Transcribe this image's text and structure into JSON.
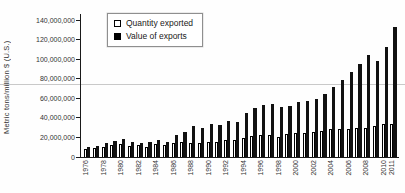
{
  "chart_data": {
    "type": "bar",
    "title": "",
    "xlabel": "",
    "ylabel": "Metric tons/million $ (U.S.)",
    "unit_note": "axis values are absolute; series values below are in millions (multiply by 1,000,000)",
    "ylim_millions": [
      0,
      140
    ],
    "grid": "single horizontal reference line",
    "gridline_value_millions": 75,
    "legend_position": "top-left inside plot",
    "yticks": [
      {
        "v": 0,
        "label": "0"
      },
      {
        "v": 20,
        "label": "20,000,000"
      },
      {
        "v": 40,
        "label": "40,000,000"
      },
      {
        "v": 60,
        "label": "60,000,000"
      },
      {
        "v": 80,
        "label": "80,000,000"
      },
      {
        "v": 100,
        "label": "100,000,000"
      },
      {
        "v": 120,
        "label": "120,000,000"
      },
      {
        "v": 140,
        "label": "140,000,000"
      }
    ],
    "years": [
      1976,
      1977,
      1978,
      1979,
      1980,
      1981,
      1982,
      1983,
      1984,
      1985,
      1986,
      1987,
      1988,
      1989,
      1990,
      1991,
      1992,
      1993,
      1994,
      1995,
      1996,
      1997,
      1998,
      1999,
      2000,
      2001,
      2002,
      2003,
      2004,
      2005,
      2006,
      2007,
      2008,
      2009,
      2010,
      2011
    ],
    "labeled_years": [
      1976,
      1978,
      1980,
      1982,
      1984,
      1986,
      1988,
      1990,
      1992,
      1994,
      1996,
      1998,
      2000,
      2002,
      2004,
      2006,
      2008,
      2010,
      2011
    ],
    "series": [
      {
        "name": "Quantity exported",
        "style": "open",
        "values_millions": [
          8,
          9,
          10,
          12,
          13,
          11,
          12,
          10,
          13,
          12,
          14,
          15,
          14,
          14,
          15,
          15,
          17,
          17,
          19,
          21,
          22,
          22,
          20,
          23,
          25,
          25,
          26,
          27,
          29,
          29,
          29,
          30,
          30,
          32,
          34,
          34
        ]
      },
      {
        "name": "Value of exports",
        "style": "filled",
        "values_millions": [
          10,
          11,
          14,
          16,
          18,
          15,
          14,
          15,
          17,
          15,
          22,
          26,
          32,
          30,
          34,
          33,
          37,
          36,
          45,
          50,
          53,
          54,
          51,
          52,
          56,
          57,
          59,
          64,
          72,
          79,
          87,
          95,
          104,
          98,
          112,
          133
        ]
      }
    ],
    "colors": {
      "bar_filled": "#111111",
      "bar_open_fill": "#ffffff",
      "bar_open_border": "#000000",
      "gridline": "#c9c9c9",
      "axis": "#1a1a1a",
      "text": "#333333"
    }
  }
}
